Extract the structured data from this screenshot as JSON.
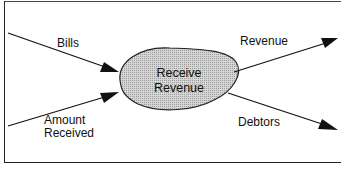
{
  "diagram": {
    "type": "data-flow",
    "process": {
      "line1": "Receive",
      "line2": "Revenue",
      "fill": "#c8c8c8"
    },
    "flows": {
      "bills": "Bills",
      "amount_received_line1": "Amount",
      "amount_received_line2": "Received",
      "revenue": "Revenue",
      "debtors": "Debtors"
    },
    "colors": {
      "line": "#111111",
      "background": "#ffffff"
    }
  }
}
